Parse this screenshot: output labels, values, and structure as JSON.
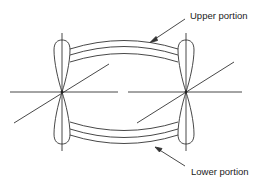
{
  "diagram": {
    "labels": {
      "upper": "Upper portion",
      "lower": "Lower portion"
    },
    "nodes": [
      {
        "id": "left-atom",
        "center": [
          62,
          92
        ]
      },
      {
        "id": "right-atom",
        "center": [
          186,
          92
        ]
      }
    ],
    "colors": {
      "line": "#333333",
      "background": "#ffffff"
    }
  }
}
